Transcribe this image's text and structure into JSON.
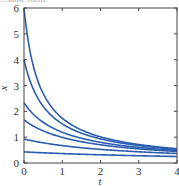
{
  "caption_fragment": "...same form.",
  "chart_data": {
    "type": "line",
    "title": "",
    "xlabel": "t",
    "ylabel": "x",
    "xlim": [
      0,
      4
    ],
    "ylim": [
      0,
      6
    ],
    "xticks": [
      0,
      1,
      2,
      3,
      4
    ],
    "yticks": [
      0,
      1,
      2,
      3,
      4,
      5,
      6
    ],
    "grid": false,
    "legend": null,
    "line_color": "#2a5db0",
    "model": "x(t) = x0 / (1 + 0.41 * x0 * t)",
    "x": [
      0,
      0.25,
      0.5,
      1,
      1.5,
      2,
      2.5,
      3,
      3.5,
      4
    ],
    "series": [
      {
        "name": "x0=6.0",
        "values": [
          6.0,
          3.73,
          2.7,
          1.74,
          1.27,
          1.0,
          0.82,
          0.7,
          0.61,
          0.54
        ]
      },
      {
        "name": "x0=4.0",
        "values": [
          4.0,
          2.84,
          2.2,
          1.52,
          1.16,
          0.94,
          0.79,
          0.68,
          0.6,
          0.53
        ]
      },
      {
        "name": "x0=2.33",
        "values": [
          2.33,
          1.89,
          1.58,
          1.19,
          0.96,
          0.8,
          0.69,
          0.61,
          0.54,
          0.48
        ]
      },
      {
        "name": "x0=1.67",
        "values": [
          1.67,
          1.43,
          1.24,
          0.99,
          0.82,
          0.7,
          0.61,
          0.54,
          0.49,
          0.44
        ]
      },
      {
        "name": "x0=0.93",
        "values": [
          0.93,
          0.85,
          0.78,
          0.67,
          0.59,
          0.53,
          0.48,
          0.43,
          0.4,
          0.37
        ]
      },
      {
        "name": "x0=0.43",
        "values": [
          0.43,
          0.41,
          0.4,
          0.37,
          0.34,
          0.32,
          0.3,
          0.28,
          0.27,
          0.25
        ]
      }
    ]
  }
}
